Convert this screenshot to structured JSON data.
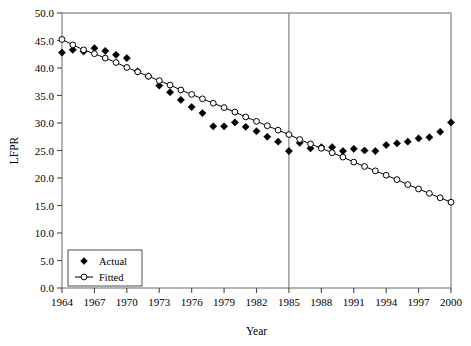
{
  "chart_data": {
    "type": "scatter",
    "title": "",
    "xlabel": "Year",
    "ylabel": "LFPR",
    "xlim": [
      1964,
      2000
    ],
    "ylim": [
      0.0,
      50.0
    ],
    "grid": false,
    "legend_position": "bottom-left",
    "x_ticks": [
      "1964",
      "1967",
      "1970",
      "1973",
      "1976",
      "1979",
      "1982",
      "1985",
      "1988",
      "1991",
      "1994",
      "1997",
      "2000"
    ],
    "x_tick_values": [
      1964,
      1967,
      1970,
      1973,
      1976,
      1979,
      1982,
      1985,
      1988,
      1991,
      1994,
      1997,
      2000
    ],
    "y_ticks": [
      "0.0",
      "5.0",
      "10.0",
      "15.0",
      "20.0",
      "25.0",
      "30.0",
      "35.0",
      "40.0",
      "45.0",
      "50.0"
    ],
    "y_tick_values": [
      0.0,
      5.0,
      10.0,
      15.0,
      20.0,
      25.0,
      30.0,
      35.0,
      40.0,
      45.0,
      50.0
    ],
    "annotations": [
      {
        "name": "reference-line-1985",
        "type": "vline",
        "x": 1985
      }
    ],
    "x": [
      1964,
      1965,
      1966,
      1967,
      1968,
      1969,
      1970,
      1971,
      1972,
      1973,
      1974,
      1975,
      1976,
      1977,
      1978,
      1979,
      1980,
      1981,
      1982,
      1983,
      1984,
      1985,
      1986,
      1987,
      1988,
      1989,
      1990,
      1991,
      1992,
      1993,
      1994,
      1995,
      1996,
      1997,
      1998,
      1999,
      2000
    ],
    "series": [
      {
        "name": "Actual",
        "marker": "filled-diamond",
        "color": "#000000",
        "line": false,
        "values": [
          42.8,
          43.3,
          43.0,
          43.6,
          43.1,
          42.4,
          41.8,
          39.4,
          38.5,
          36.8,
          35.6,
          34.2,
          32.9,
          31.8,
          29.4,
          29.4,
          30.1,
          29.3,
          28.5,
          27.5,
          26.6,
          24.9,
          26.4,
          25.4,
          25.6,
          25.6,
          24.9,
          25.3,
          25.0,
          24.9,
          26.0,
          26.3,
          26.6,
          27.2,
          27.4,
          28.4,
          30.1
        ]
      },
      {
        "name": "Fitted",
        "marker": "open-circle",
        "color": "#000000",
        "line": true,
        "values": [
          45.2,
          44.2,
          43.3,
          42.6,
          41.8,
          41.0,
          40.1,
          39.3,
          38.5,
          37.7,
          36.9,
          36.0,
          35.2,
          34.4,
          33.6,
          32.8,
          32.0,
          31.1,
          30.3,
          29.5,
          28.7,
          27.9,
          27.0,
          26.2,
          25.4,
          24.6,
          23.8,
          22.9,
          22.1,
          21.3,
          20.5,
          19.7,
          18.8,
          18.0,
          17.2,
          16.4,
          15.6
        ]
      }
    ]
  },
  "legend": {
    "items": [
      {
        "label": "Actual",
        "marker": "filled-diamond"
      },
      {
        "label": "Fitted",
        "marker": "line-open-circle"
      }
    ]
  }
}
